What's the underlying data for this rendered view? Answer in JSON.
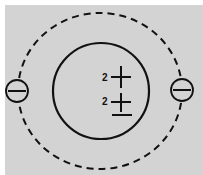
{
  "diagram": {
    "type": "atom-model",
    "background_color": "#d3d3d3",
    "nucleus": {
      "charges": [
        {
          "coefficient": "2",
          "symbol": "+"
        },
        {
          "coefficient": "2",
          "symbol": "±"
        }
      ]
    },
    "orbit": {
      "style": "dashed"
    },
    "electrons": [
      {
        "position": "left",
        "symbol": "−"
      },
      {
        "position": "right",
        "symbol": "−"
      }
    ]
  }
}
